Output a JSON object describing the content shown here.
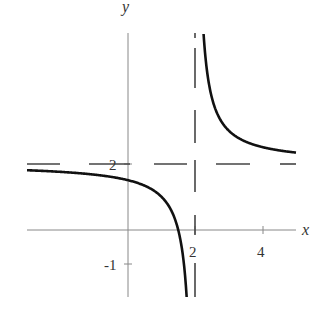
{
  "chart_data": {
    "type": "line",
    "title": "",
    "function": "y = 2 + 1/(x - 2)",
    "xlabel": "x",
    "ylabel": "y",
    "x_ticks": [
      {
        "value": 2,
        "label": "2"
      },
      {
        "value": 4,
        "label": "4"
      }
    ],
    "y_ticks": [
      {
        "value": 2,
        "label": "2"
      },
      {
        "value": -1,
        "label": "-1"
      }
    ],
    "xlim": [
      -3,
      5
    ],
    "ylim": [
      -2,
      6
    ],
    "grid": false,
    "asymptotes": {
      "vertical": {
        "x": 2,
        "style": "dashed"
      },
      "horizontal": {
        "y": 2,
        "style": "dashed"
      }
    },
    "series": [
      {
        "name": "left branch",
        "x": [
          -3,
          -2,
          -1,
          0,
          1,
          1.5,
          1.75
        ],
        "values": [
          1.8,
          1.75,
          1.67,
          1.5,
          1.0,
          0.0,
          -2.0
        ]
      },
      {
        "name": "right branch",
        "x": [
          2.25,
          2.5,
          3,
          4,
          5
        ],
        "values": [
          6.0,
          4.0,
          3.0,
          2.5,
          2.33
        ]
      }
    ]
  },
  "labels": {
    "x_axis": "x",
    "y_axis": "y",
    "tick_x2": "2",
    "tick_x4": "4",
    "tick_y2": "2",
    "tick_ym1": "-1"
  }
}
